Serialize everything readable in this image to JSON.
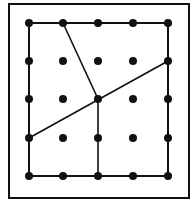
{
  "diagram": {
    "type": "geoboard",
    "frame": {
      "x": 9,
      "y": 4,
      "w": 180,
      "h": 194
    },
    "grid": {
      "cols": 5,
      "rows": 5,
      "xs": [
        29,
        63,
        98,
        133,
        168
      ],
      "ys": [
        23,
        61,
        99,
        138,
        176
      ]
    },
    "boundary": {
      "x1": 29,
      "y1": 23,
      "x2": 168,
      "y2": 176
    },
    "segments": [
      {
        "x1": 63,
        "y1": 23,
        "x2": 98,
        "y2": 99
      },
      {
        "x1": 29,
        "y1": 138,
        "x2": 168,
        "y2": 61
      },
      {
        "x1": 98,
        "y1": 99,
        "x2": 98,
        "y2": 176
      }
    ],
    "colors": {
      "ink": "#111111",
      "background": "#ffffff"
    }
  }
}
